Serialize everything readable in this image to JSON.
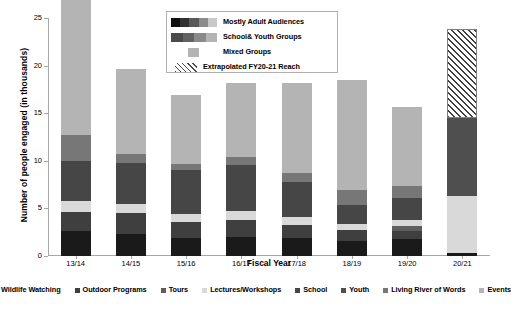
{
  "chart_data": {
    "type": "bar",
    "stacked": true,
    "title": "",
    "xlabel": "Fiscal Year",
    "ylabel": "Number of people engaged (in thousands)",
    "ylim": [
      0,
      25
    ],
    "yticks": [
      0,
      5,
      10,
      15,
      20,
      25
    ],
    "ytick_labels": [
      "0",
      "5",
      "10",
      "15",
      "20",
      "25"
    ],
    "grid": false,
    "categories": [
      "13/14",
      "14/15",
      "15/16",
      "16/17",
      "17/18",
      "18/19",
      "19/20",
      "20/21"
    ],
    "series": [
      {
        "name": "Wildlife Watching",
        "color": "#1a1a1a",
        "values": [
          2.6,
          2.3,
          1.9,
          2.0,
          1.9,
          1.6,
          1.8,
          0.35
        ]
      },
      {
        "name": "Outdoor Programs",
        "color": "#3f3f3f",
        "values": [
          2.0,
          2.2,
          1.7,
          1.8,
          1.4,
          1.1,
          0.8,
          0.0
        ]
      },
      {
        "name": "Tours",
        "color": "#5e5e5e",
        "values": [
          0.0,
          0.0,
          0.0,
          0.0,
          0.0,
          0.0,
          0.5,
          0.0
        ]
      },
      {
        "name": "Lectures/Workshops",
        "color": "#d9d9d9",
        "values": [
          1.2,
          1.0,
          0.8,
          0.9,
          0.8,
          0.7,
          0.7,
          6.0
        ]
      },
      {
        "name": "School",
        "color": "#464646",
        "values": [
          4.2,
          4.3,
          4.6,
          4.9,
          3.7,
          2.0,
          2.3,
          0.0
        ]
      },
      {
        "name": "Youth",
        "color": "#4f4f4f",
        "values": [
          0.0,
          0.0,
          0.0,
          0.0,
          0.0,
          0.0,
          0.0,
          8.1
        ]
      },
      {
        "name": "Living River of Words",
        "color": "#777777",
        "values": [
          2.7,
          0.9,
          0.7,
          0.8,
          0.9,
          1.5,
          1.3,
          0.0
        ]
      },
      {
        "name": "Events",
        "color": "#b4b4b4",
        "values": [
          18.3,
          8.9,
          7.2,
          7.8,
          9.5,
          11.6,
          8.3,
          0.0
        ]
      }
    ],
    "totals": [
      31.0,
      19.6,
      16.9,
      18.2,
      18.2,
      18.5,
      15.7,
      14.45
    ],
    "extrapolated": {
      "label": "Extrapolated FY20-21 Reach",
      "category": "20/21",
      "from": 14.45,
      "to": 23.8
    }
  },
  "yaxis": {
    "title": "Number of people engaged (in thousands)",
    "ticks": [
      "25",
      "20",
      "15",
      "10",
      "5",
      "0"
    ]
  },
  "xaxis": {
    "title": "Fiscal Year",
    "labels": [
      "13/14",
      "14/15",
      "15/16",
      "16/17",
      "17/18",
      "18/19",
      "19/20",
      "20/21"
    ]
  },
  "legend_top": {
    "items": [
      {
        "label": "Mostly Adult Audiences",
        "type": "gradient",
        "colors": [
          "#101010",
          "#303030",
          "#595959",
          "#8c8c8c",
          "#c9c9c9"
        ]
      },
      {
        "label": "School& Youth Groups",
        "type": "gradient",
        "colors": [
          "#4a4a4a",
          "#626262",
          "#8a8a8a",
          "#b4b4b4"
        ]
      },
      {
        "label": "Mixed Groups",
        "type": "solid",
        "colors": [
          "#b4b4b4"
        ]
      },
      {
        "label": "Extrapolated FY20-21 Reach",
        "type": "hatch",
        "colors": [
          "#4a4a4a"
        ]
      }
    ]
  },
  "legend_bottom": {
    "items": [
      {
        "label": "Wildlife Watching",
        "color": "#1a1a1a"
      },
      {
        "label": "Outdoor Programs",
        "color": "#3f3f3f"
      },
      {
        "label": "Tours",
        "color": "#5e5e5e"
      },
      {
        "label": "Lectures/Workshops",
        "color": "#d9d9d9"
      },
      {
        "label": "School",
        "color": "#464646"
      },
      {
        "label": "Youth",
        "color": "#4f4f4f"
      },
      {
        "label": "Living River of Words",
        "color": "#777777"
      },
      {
        "label": "Events",
        "color": "#b4b4b4"
      }
    ]
  }
}
